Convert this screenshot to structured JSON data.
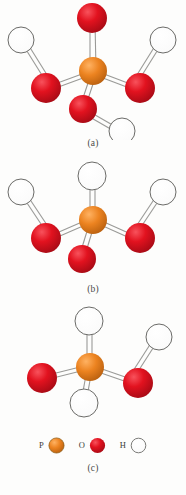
{
  "figure": {
    "title_visible": false,
    "panels": [
      {
        "id": "a",
        "caption": "(a)",
        "central_atom": "P",
        "substituents": [
          {
            "position": "top",
            "atom": "O",
            "bond": "double",
            "terminal_h": false
          },
          {
            "position": "left",
            "atom": "O",
            "bond": "single",
            "terminal_h": true
          },
          {
            "position": "right",
            "atom": "O",
            "bond": "single",
            "terminal_h": true
          },
          {
            "position": "bottom",
            "atom": "O",
            "bond": "single",
            "terminal_h": true
          }
        ]
      },
      {
        "id": "b",
        "caption": "(b)",
        "central_atom": "P",
        "substituents": [
          {
            "position": "top",
            "atom": "H",
            "bond": "single",
            "terminal_h": false
          },
          {
            "position": "left",
            "atom": "O",
            "bond": "single",
            "terminal_h": true
          },
          {
            "position": "right",
            "atom": "O",
            "bond": "single",
            "terminal_h": true
          },
          {
            "position": "bottom",
            "atom": "O",
            "bond": "double",
            "terminal_h": false
          }
        ]
      },
      {
        "id": "c",
        "caption": "(c)",
        "central_atom": "P",
        "substituents": [
          {
            "position": "top",
            "atom": "H",
            "bond": "single",
            "terminal_h": false
          },
          {
            "position": "left",
            "atom": "O",
            "bond": "double",
            "terminal_h": false
          },
          {
            "position": "right",
            "atom": "O",
            "bond": "single",
            "terminal_h": true
          },
          {
            "position": "bottom",
            "atom": "H",
            "bond": "single",
            "terminal_h": false
          }
        ]
      }
    ],
    "legend": [
      {
        "symbol": "P",
        "color": "#e8821e"
      },
      {
        "symbol": "O",
        "color": "#d81020"
      },
      {
        "symbol": "H",
        "color": "#ffffff"
      }
    ],
    "colors": {
      "phosphorus": "#e8821e",
      "oxygen": "#d81020",
      "hydrogen": "#ffffff",
      "bond_stroke": "#8d8d8a",
      "atom_outline": "#6b6b68",
      "background": "#fdfdfc",
      "caption_text": "#4a4a48"
    }
  }
}
